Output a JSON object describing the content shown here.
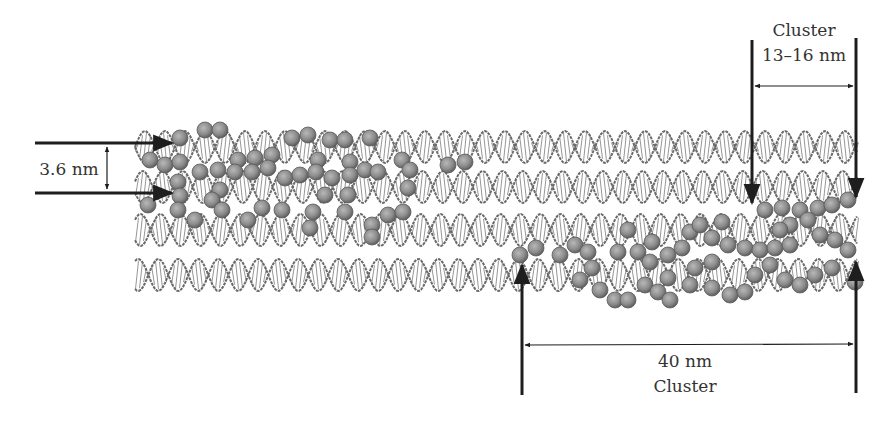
{
  "figure": {
    "colors": {
      "background": "#ffffff",
      "helix_stroke": "#6a6a6a",
      "helix_rung": "#8a8a8a",
      "particle_fill": "#8c8c8c",
      "particle_edge": "#5a5a5a",
      "arrow": "#1e1e1e",
      "text": "#333333"
    },
    "helix_rows": [
      {
        "id": "row-1",
        "y_center": 147,
        "x_start": 135,
        "x_end": 858
      },
      {
        "id": "row-2",
        "y_center": 187,
        "x_start": 135,
        "x_end": 858
      },
      {
        "id": "row-3",
        "y_center": 230,
        "x_start": 135,
        "x_end": 858
      },
      {
        "id": "row-4",
        "y_center": 275,
        "x_start": 135,
        "x_end": 858
      }
    ],
    "helix_period_px": 40,
    "helix_amplitude_px": 16
  },
  "annotations": {
    "spacing": {
      "label": "3.6 nm"
    },
    "small_cluster": {
      "line1": "Cluster",
      "line2": "13–16 nm"
    },
    "large_cluster": {
      "line1": "40 nm",
      "line2": "Cluster"
    }
  },
  "particles": {
    "radius": 8,
    "left_group": [
      [
        180,
        138
      ],
      [
        205,
        130
      ],
      [
        220,
        130
      ],
      [
        238,
        160
      ],
      [
        255,
        158
      ],
      [
        272,
        155
      ],
      [
        292,
        138
      ],
      [
        308,
        135
      ],
      [
        330,
        140
      ],
      [
        345,
        140
      ],
      [
        370,
        138
      ],
      [
        150,
        160
      ],
      [
        165,
        165
      ],
      [
        180,
        162
      ],
      [
        178,
        182
      ],
      [
        180,
        196
      ],
      [
        200,
        172
      ],
      [
        218,
        170
      ],
      [
        220,
        190
      ],
      [
        235,
        172
      ],
      [
        252,
        172
      ],
      [
        268,
        168
      ],
      [
        285,
        178
      ],
      [
        300,
        175
      ],
      [
        318,
        160
      ],
      [
        316,
        172
      ],
      [
        332,
        178
      ],
      [
        350,
        162
      ],
      [
        350,
        175
      ],
      [
        365,
        170
      ],
      [
        378,
        172
      ],
      [
        402,
        160
      ],
      [
        410,
        170
      ],
      [
        408,
        188
      ],
      [
        148,
        205
      ],
      [
        178,
        210
      ],
      [
        195,
        220
      ],
      [
        212,
        200
      ],
      [
        222,
        210
      ],
      [
        248,
        220
      ],
      [
        262,
        208
      ],
      [
        282,
        210
      ],
      [
        313,
        212
      ],
      [
        325,
        195
      ],
      [
        348,
        195
      ],
      [
        345,
        212
      ],
      [
        372,
        225
      ],
      [
        388,
        215
      ],
      [
        403,
        212
      ],
      [
        372,
        237
      ],
      [
        310,
        228
      ],
      [
        448,
        165
      ],
      [
        465,
        162
      ]
    ],
    "right_group": [
      [
        520,
        255
      ],
      [
        536,
        248
      ],
      [
        560,
        255
      ],
      [
        575,
        245
      ],
      [
        588,
        252
      ],
      [
        592,
        268
      ],
      [
        580,
        280
      ],
      [
        600,
        290
      ],
      [
        615,
        300
      ],
      [
        628,
        300
      ],
      [
        645,
        285
      ],
      [
        628,
        230
      ],
      [
        618,
        252
      ],
      [
        638,
        252
      ],
      [
        652,
        242
      ],
      [
        668,
        255
      ],
      [
        682,
        248
      ],
      [
        690,
        232
      ],
      [
        700,
        225
      ],
      [
        712,
        238
      ],
      [
        728,
        245
      ],
      [
        745,
        248
      ],
      [
        760,
        250
      ],
      [
        775,
        248
      ],
      [
        790,
        245
      ],
      [
        650,
        262
      ],
      [
        668,
        278
      ],
      [
        658,
        292
      ],
      [
        670,
        300
      ],
      [
        690,
        285
      ],
      [
        712,
        288
      ],
      [
        730,
        295
      ],
      [
        745,
        292
      ],
      [
        755,
        275
      ],
      [
        770,
        265
      ],
      [
        785,
        280
      ],
      [
        800,
        285
      ],
      [
        815,
        275
      ],
      [
        832,
        268
      ],
      [
        848,
        250
      ],
      [
        820,
        235
      ],
      [
        835,
        240
      ],
      [
        790,
        225
      ],
      [
        765,
        210
      ],
      [
        782,
        208
      ],
      [
        800,
        210
      ],
      [
        818,
        208
      ],
      [
        832,
        205
      ],
      [
        848,
        200
      ],
      [
        808,
        220
      ],
      [
        780,
        230
      ],
      [
        722,
        222
      ],
      [
        712,
        262
      ],
      [
        695,
        268
      ],
      [
        855,
        282
      ]
    ]
  }
}
